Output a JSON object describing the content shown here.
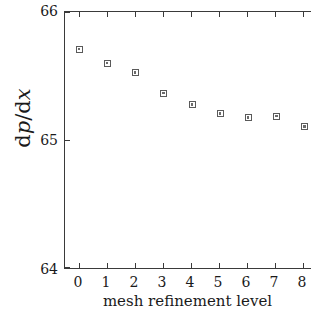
{
  "chart_data": {
    "type": "scatter",
    "title": "",
    "xlabel": "mesh refinement level",
    "ylabel": "dp/dx",
    "ylabel_parts": {
      "d1": "d",
      "p": "p",
      "slash": "/",
      "d2": "d",
      "x": "x"
    },
    "x": [
      0,
      1,
      2,
      3,
      4,
      5,
      6,
      7,
      8
    ],
    "values": [
      65.71,
      65.6,
      65.53,
      65.37,
      65.28,
      65.21,
      65.18,
      65.19,
      65.11
    ],
    "series": [
      {
        "name": "dp/dx",
        "values": [
          65.71,
          65.6,
          65.53,
          65.37,
          65.28,
          65.21,
          65.18,
          65.19,
          65.11
        ]
      }
    ],
    "xlim": [
      -0.5,
      8.5
    ],
    "ylim": [
      64,
      66
    ],
    "xticks": [
      0,
      1,
      2,
      3,
      4,
      5,
      6,
      7,
      8
    ],
    "xticklabels": [
      "0",
      "1",
      "2",
      "3",
      "4",
      "5",
      "6",
      "7",
      "8"
    ],
    "yticks": [
      64,
      65,
      66
    ],
    "yticklabels": [
      "64",
      "65",
      "66"
    ],
    "grid": false,
    "legend": null,
    "marker": "open-square",
    "marker_color": "#5a5a5a",
    "axis_color": "#3a3a3a",
    "background": "#ffffff"
  }
}
